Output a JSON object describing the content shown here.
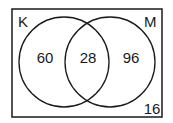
{
  "diagram": {
    "type": "venn",
    "universe": {
      "outside_value": "16"
    },
    "sets": [
      {
        "id": "K",
        "label": "K",
        "only_value": "60"
      },
      {
        "id": "M",
        "label": "M",
        "only_value": "96"
      }
    ],
    "intersection": {
      "sets": [
        "K",
        "M"
      ],
      "value": "28"
    },
    "colors": {
      "stroke": "#1a1a1a",
      "background": "#ffffff"
    }
  }
}
